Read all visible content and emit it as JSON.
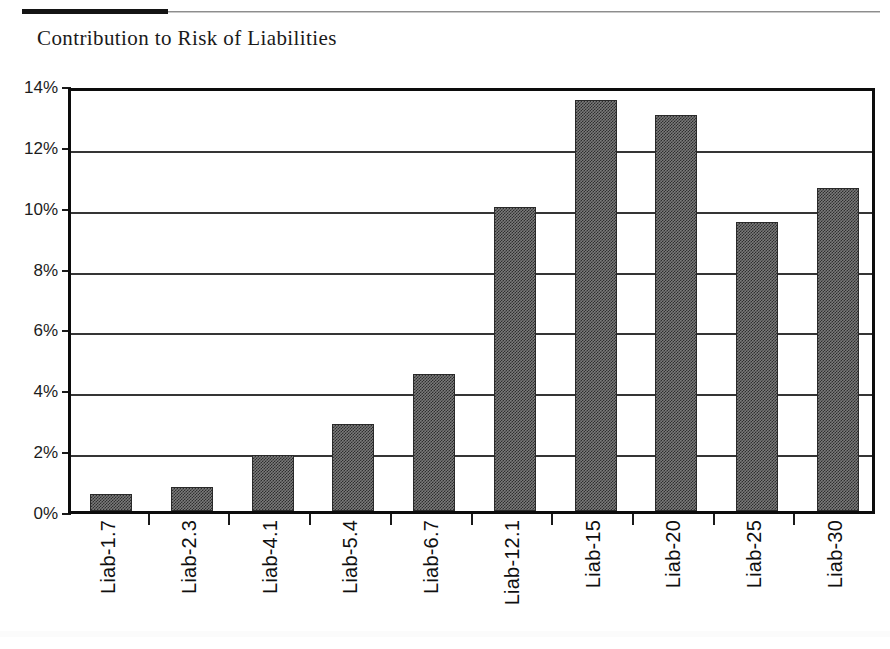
{
  "document": {
    "title": "Contribution to Risk of Liabilities",
    "rule_color": "#141414"
  },
  "chart_data": {
    "type": "bar",
    "title": "Contribution to Risk of Liabilities",
    "xlabel": "",
    "ylabel": "",
    "categories": [
      "Liab-1.7",
      "Liab-2.3",
      "Liab-4.1",
      "Liab-5.4",
      "Liab-6.7",
      "Liab-12.1",
      "Liab-15",
      "Liab-20",
      "Liab-25",
      "Liab-30"
    ],
    "values": [
      0.55,
      0.8,
      1.85,
      2.85,
      4.5,
      10.0,
      13.5,
      13.0,
      9.5,
      10.6
    ],
    "value_unit": "%",
    "ylim": [
      0,
      14
    ],
    "ytick_values": [
      0,
      2,
      4,
      6,
      8,
      10,
      12,
      14
    ],
    "ytick_labels": [
      "0%",
      "2%",
      "4%",
      "6%",
      "8%",
      "10%",
      "12%",
      "14%"
    ],
    "grid": true,
    "grid_axis": "y",
    "legend": false,
    "bar_fill": "#7a7a7a",
    "bar_pattern": "checkerboard-dither",
    "bar_border": "#2a2a2a",
    "axis_color": "#0c0c0c"
  }
}
